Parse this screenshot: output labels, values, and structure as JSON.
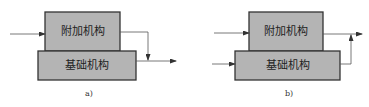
{
  "diagrams": [
    {
      "id": "a",
      "caption": "a)",
      "top_box_label": "附加机构",
      "bottom_box_label": "基础机构",
      "description": "Input enters additional mechanism; its output merges into base mechanism output line"
    },
    {
      "id": "b",
      "caption": "b)",
      "top_box_label": "附加机构",
      "bottom_box_label": "基础机构",
      "description": "Separate inputs to additional and base mechanisms; base output joins additional output line"
    }
  ],
  "colors": {
    "box_fill": "#b4b4b4",
    "box_stroke": "#333333",
    "line": "#555555"
  }
}
